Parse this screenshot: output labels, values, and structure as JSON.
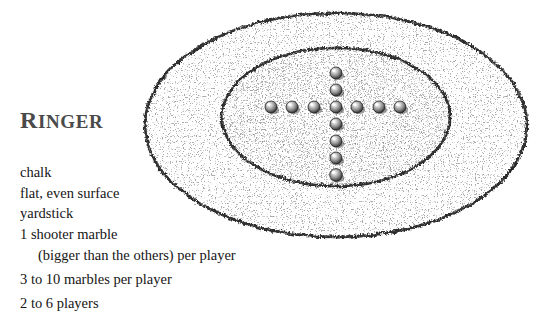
{
  "page": {
    "width": 542,
    "height": 331,
    "background_color": "#ffffff",
    "ink_color": "#1a1a1a"
  },
  "title": {
    "full": "RINGER",
    "initial": "R",
    "rest": "INGER",
    "color": "#4a4a4a"
  },
  "materials": {
    "items": [
      {
        "text": "chalk",
        "indent": false
      },
      {
        "text": "flat, even surface",
        "indent": false
      },
      {
        "text": "yardstick",
        "indent": false
      },
      {
        "text": "1 shooter marble",
        "indent": false
      },
      {
        "text": "(bigger than the others) per player",
        "indent": true
      },
      {
        "text": "3 to 10 marbles per player",
        "indent": false
      },
      {
        "text": "2 to 6 players",
        "indent": false
      }
    ]
  },
  "diagram": {
    "name": "ringer-playing-field",
    "line_color": "#2b2b2b",
    "fill_color": "#ffffff",
    "outer_ring": {
      "cx": 336,
      "cy": 125,
      "rx": 191,
      "ry": 112
    },
    "inner_ring": {
      "cx": 336,
      "cy": 117,
      "rx": 114,
      "ry": 69
    },
    "marble": {
      "radius": 6,
      "count_total": 13,
      "count_horizontal": 7,
      "count_vertical": 7,
      "body_color": "#7d7d7d",
      "shadow_color": "#2d2d2d",
      "highlight_color": "#f2f2f2"
    },
    "marbles_horizontal": [
      {
        "cx": 271,
        "cy": 107
      },
      {
        "cx": 292,
        "cy": 107
      },
      {
        "cx": 314,
        "cy": 107
      },
      {
        "cx": 336,
        "cy": 107
      },
      {
        "cx": 357,
        "cy": 107
      },
      {
        "cx": 379,
        "cy": 107
      },
      {
        "cx": 400,
        "cy": 107
      }
    ],
    "marbles_vertical": [
      {
        "cx": 336,
        "cy": 73
      },
      {
        "cx": 336,
        "cy": 90
      },
      {
        "cx": 336,
        "cy": 107
      },
      {
        "cx": 336,
        "cy": 124
      },
      {
        "cx": 336,
        "cy": 141
      },
      {
        "cx": 336,
        "cy": 158
      },
      {
        "cx": 336,
        "cy": 175
      }
    ]
  }
}
